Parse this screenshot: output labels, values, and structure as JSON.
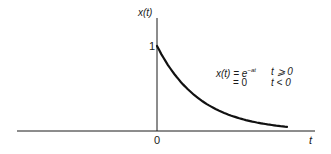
{
  "chart_data": {
    "type": "line",
    "title": "",
    "xlabel": "t",
    "ylabel": "x(t)",
    "x_ticks": [
      "0"
    ],
    "y_ticks": [
      "1"
    ],
    "grid": false,
    "legend": null,
    "series": [
      {
        "name": "x(t) = e^{-at}, t >= 0; 0, t < 0",
        "x": [
          0,
          0.25,
          0.5,
          0.75,
          1.0,
          1.25,
          1.5,
          1.75,
          2.0,
          2.5,
          3.0
        ],
        "values": [
          1.0,
          0.78,
          0.61,
          0.47,
          0.37,
          0.29,
          0.22,
          0.17,
          0.14,
          0.08,
          0.05
        ]
      }
    ],
    "annotations": [
      "x(t) = e^{-at}   t ≥ 0",
      "= 0   t < 0"
    ],
    "ylim": [
      0,
      1.15
    ]
  },
  "labels": {
    "y_axis": "x(t)",
    "x_axis": "t",
    "origin": "0",
    "y_one": "1",
    "eq_line1_lhs": "x(t) = e",
    "eq_line1_exp": "−at",
    "eq_line1_cond": "t ⩾ 0",
    "eq_line2_lhs": "= 0",
    "eq_line2_cond": "t < 0"
  }
}
